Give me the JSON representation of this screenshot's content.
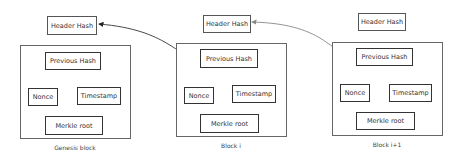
{
  "blocks": [
    {
      "name": "Genesis block",
      "header_hash": "Header Hash",
      "previous_hash": "Previous Hash",
      "nonce": "Nonce",
      "timestamp": "Timestamp",
      "merkle_root": "Merkle root"
    },
    {
      "name": "Block i",
      "header_hash": "Header Hash",
      "previous_hash": "Previous Hash",
      "nonce": "Nonce",
      "timestamp": "Timestamp",
      "merkle_root": "Merkle root"
    },
    {
      "name": "Block i+1",
      "header_hash": "Header Hash",
      "previous_hash": "Previous Hash",
      "nonce": "Nonce",
      "timestamp": "Timestamp",
      "merkle_root": "Merkle root"
    }
  ],
  "colors": {
    "arrow_dark": "#333333",
    "arrow_light": "#888888",
    "border": "#333333"
  }
}
